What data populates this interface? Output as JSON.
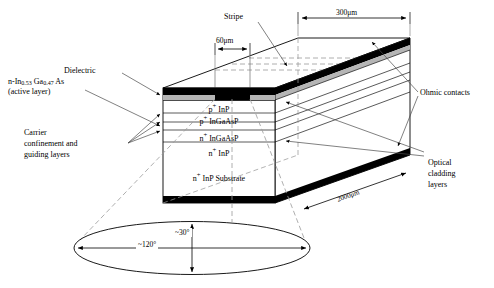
{
  "figure": {
    "type": "cross-section-3d-diagram"
  },
  "labels": {
    "dielectric": "Dielectric",
    "active_layer_formula_prefix": "n-In",
    "active_layer_sub1": "0.53",
    "active_layer_mid": " Ga",
    "active_layer_sub2": "0.47",
    "active_layer_suffix": " As",
    "active_layer_note": "(active layer)",
    "carrier_line1": "Carrier",
    "carrier_line2": "confinement and",
    "carrier_line3": "guiding layers",
    "stripe": "Stripe",
    "ohmic_contacts": "Ohmic contacts",
    "optical_line1": "Optical",
    "optical_line2": "cladding",
    "optical_line3": "layers"
  },
  "layers": [
    {
      "id": "p-inp",
      "pre": "p",
      "sup": "+",
      "post": " InP"
    },
    {
      "id": "p-ingaasp",
      "pre": "p",
      "sup": "+",
      "post": " InGaAsP"
    },
    {
      "id": "n-ingaasp",
      "pre": "n",
      "sup": "+",
      "post": " InGaAsP"
    },
    {
      "id": "n-inp",
      "pre": "n",
      "sup": "+",
      "post": " InP"
    },
    {
      "id": "n-inp-substrate",
      "pre": "n",
      "sup": "+",
      "post": " InP Substrate"
    }
  ],
  "dimensions": {
    "stripe_width": "60μm",
    "device_width": "300μm",
    "cavity_length": "2000μm"
  },
  "far_field": {
    "horizontal_angle": "~120°",
    "vertical_angle": "~30°"
  },
  "colors": {
    "ink": "#000000",
    "contact_black": "#000000",
    "dielectric_gray": "#b5b5b5",
    "background": "#ffffff",
    "guide_line": "#8a8a8a",
    "dashed": "#9a9a9a"
  }
}
